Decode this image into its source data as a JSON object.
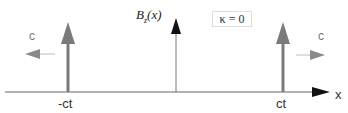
{
  "diagram": {
    "y_label": "B_z(x)",
    "y_label_main": "B",
    "y_label_sub": "z",
    "y_label_arg": "(x)",
    "kappa_label": "κ = 0",
    "x_axis_label": "x",
    "left_pulse_label": "-ct",
    "right_pulse_label": "ct",
    "left_velocity_label": "c",
    "right_velocity_label": "c",
    "colors": {
      "pulse": "#7a7a7a",
      "axis": "#555555",
      "velocity_arrow": "#8a8a8a",
      "y_axis_arrow": "#111111"
    }
  }
}
